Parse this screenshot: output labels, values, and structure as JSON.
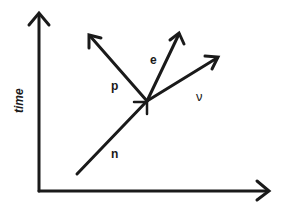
{
  "diagram": {
    "type": "feynman-diagram",
    "axes": {
      "vertical_label": "time",
      "vertical_has_arrow": true,
      "horizontal_has_arrow": true
    },
    "particles": [
      {
        "id": "n",
        "label": "n",
        "direction": "incoming"
      },
      {
        "id": "p",
        "label": "p",
        "direction": "outgoing"
      },
      {
        "id": "e",
        "label": "e",
        "direction": "outgoing"
      },
      {
        "id": "nu",
        "label": "ν",
        "direction": "outgoing"
      }
    ],
    "colors": {
      "ink": "#1a1a1a",
      "background": "#ffffff"
    }
  }
}
